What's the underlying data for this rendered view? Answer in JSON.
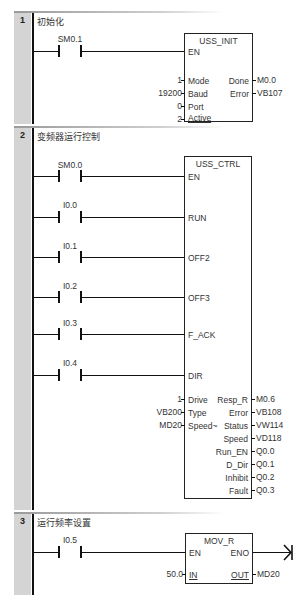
{
  "networks": [
    {
      "number": "1",
      "title": "初始化",
      "contacts": [
        {
          "address": "SM0.1"
        }
      ],
      "block": {
        "name": "USS_INIT",
        "enable_pin": "EN",
        "inputs": [
          {
            "value": "1",
            "pin": "Mode"
          },
          {
            "value": "19200",
            "pin": "Baud"
          },
          {
            "value": "0",
            "pin": "Port"
          },
          {
            "value": "2",
            "pin": "Active"
          }
        ],
        "outputs": [
          {
            "pin": "Done",
            "value": "M0.0"
          },
          {
            "pin": "Error",
            "value": "VB107"
          }
        ]
      }
    },
    {
      "number": "2",
      "title": "变频器运行控制",
      "contacts": [
        {
          "address": "SM0.0",
          "pin": "EN"
        },
        {
          "address": "I0.0",
          "pin": "RUN"
        },
        {
          "address": "I0.1",
          "pin": "OFF2"
        },
        {
          "address": "I0.2",
          "pin": "OFF3"
        },
        {
          "address": "I0.3",
          "pin": "F_ACK"
        },
        {
          "address": "I0.4",
          "pin": "DIR"
        }
      ],
      "block": {
        "name": "USS_CTRL",
        "inputs": [
          {
            "value": "1",
            "pin": "Drive"
          },
          {
            "value": "VB200",
            "pin": "Type"
          },
          {
            "value": "MD20",
            "pin": "Speed~"
          }
        ],
        "outputs": [
          {
            "pin": "Resp_R",
            "value": "M0.6"
          },
          {
            "pin": "Error",
            "value": "VB108"
          },
          {
            "pin": "Status",
            "value": "VW114"
          },
          {
            "pin": "Speed",
            "value": "VD118"
          },
          {
            "pin": "Run_EN",
            "value": "Q0.0"
          },
          {
            "pin": "D_Dir",
            "value": "Q0.1"
          },
          {
            "pin": "Inhibit",
            "value": "Q0.2"
          },
          {
            "pin": "Fault",
            "value": "Q0.3"
          }
        ]
      }
    },
    {
      "number": "3",
      "title": "运行频率设置",
      "contacts": [
        {
          "address": "I0.5"
        }
      ],
      "block": {
        "name": "MOV_R",
        "enable_pin": "EN",
        "eno_pin": "ENO",
        "inputs": [
          {
            "value": "50.0",
            "pin": "IN"
          }
        ],
        "outputs": [
          {
            "pin": "OUT",
            "value": "MD20"
          }
        ]
      }
    }
  ]
}
